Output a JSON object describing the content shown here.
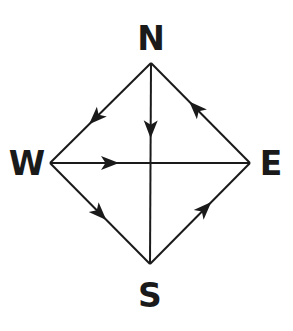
{
  "diagram": {
    "type": "directed-graph",
    "vertices": [
      {
        "id": "N",
        "label": "N",
        "x": 151,
        "y": 63,
        "label_x": 151,
        "label_y": 50
      },
      {
        "id": "W",
        "label": "W",
        "x": 50,
        "y": 163,
        "label_x": 27,
        "label_y": 175
      },
      {
        "id": "E",
        "label": "E",
        "x": 250,
        "y": 163,
        "label_x": 271,
        "label_y": 175
      },
      {
        "id": "S",
        "label": "S",
        "x": 150,
        "y": 264,
        "label_x": 150,
        "label_y": 307
      }
    ],
    "edges": [
      {
        "from": "N",
        "to": "W",
        "arrow_t": 0.55
      },
      {
        "from": "N",
        "to": "S",
        "arrow_t": 0.33
      },
      {
        "from": "E",
        "to": "N",
        "arrow_t": 0.55
      },
      {
        "from": "W",
        "to": "E",
        "arrow_t": 0.3
      },
      {
        "from": "W",
        "to": "S",
        "arrow_t": 0.5
      },
      {
        "from": "S",
        "to": "E",
        "arrow_t": 0.55
      }
    ],
    "colors": {
      "stroke": "#1a1a1a",
      "background": "#ffffff"
    }
  }
}
